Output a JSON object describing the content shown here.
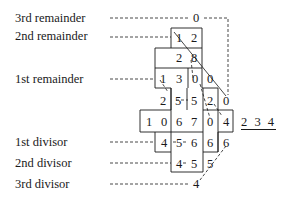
{
  "labels": {
    "rem3": "3rd remainder",
    "rem2": "2nd remainder",
    "rem1": "1st remainder",
    "div1": "1st divisor",
    "div2": "2nd divisor",
    "div3": "3rd divisor"
  },
  "divisor_display": "2 3 4",
  "rows": {
    "r0": [
      "0"
    ],
    "r1": [
      "1",
      "2"
    ],
    "r2": [
      "2",
      "8"
    ],
    "r3": [
      "1",
      "3",
      "0",
      "0"
    ],
    "r4": [
      "2",
      "5",
      "5",
      "2",
      "0"
    ],
    "r5": [
      "1",
      "0",
      "6",
      "7",
      "0",
      "4"
    ],
    "r6": [
      "4",
      "5",
      "6",
      "6",
      "6"
    ],
    "r7": [
      "4",
      "5",
      "5"
    ],
    "r8": [
      "4"
    ]
  },
  "colors": {
    "ink": "#1a1a1a",
    "background": "#ffffff"
  }
}
